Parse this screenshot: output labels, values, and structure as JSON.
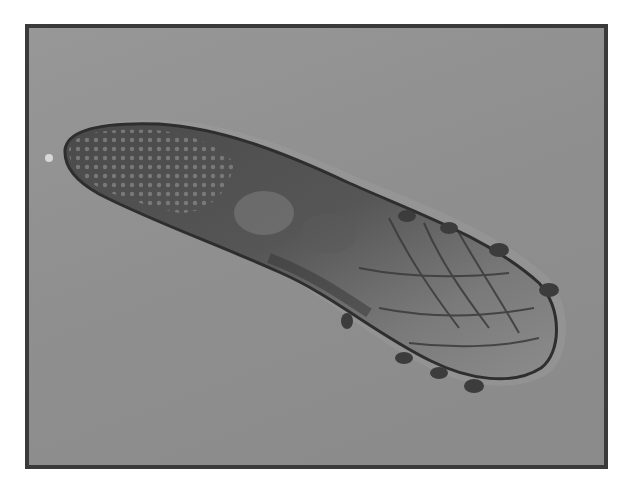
{
  "image": {
    "subject": "demodex-mite-micrograph",
    "colors": {
      "border": "#3a3a3a",
      "background": "#8e8e8e",
      "body_dark": "#3e3e3e",
      "body_mid": "#6a6a6a",
      "body_light": "#a8a8a8"
    }
  }
}
